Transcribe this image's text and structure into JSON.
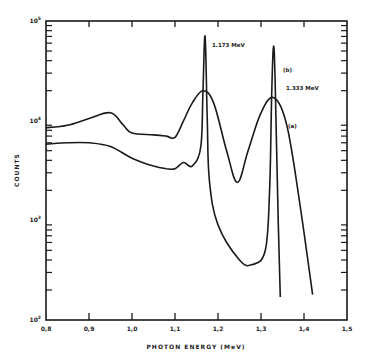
{
  "chart_data": {
    "type": "line",
    "title": "",
    "xlabel": "PHOTON ENERGY (MeV)",
    "ylabel": "COUNTS",
    "xlim": [
      0.8,
      1.5
    ],
    "ylim": [
      100,
      100000
    ],
    "yscale": "log",
    "grid": false,
    "legend": "inline labels",
    "x_ticks": [
      "0.8",
      "0.9",
      "1.0",
      "1.1",
      "1.2",
      "1.3",
      "1.4",
      "1.5"
    ],
    "y_ticks": [
      "10^2",
      "10^3",
      "10^4",
      "10^5"
    ],
    "annotations": [
      {
        "text": "1.173 MeV",
        "x": 1.175,
        "y": 65000
      },
      {
        "text": "1.333 MeV",
        "x": 1.345,
        "y": 25000
      },
      {
        "text": "(b)",
        "x": 1.345,
        "y": 50000
      },
      {
        "text": "(a)",
        "x": 1.37,
        "y": 12000
      }
    ],
    "series": [
      {
        "name": "(a)",
        "description": "broad-resolution spectrum",
        "x": [
          0.8,
          0.85,
          0.9,
          0.95,
          0.98,
          1.0,
          1.05,
          1.08,
          1.1,
          1.12,
          1.14,
          1.165,
          1.19,
          1.22,
          1.245,
          1.27,
          1.3,
          1.33,
          1.36,
          1.39,
          1.42
        ],
        "y": [
          8500,
          9000,
          10500,
          12000,
          9000,
          7500,
          7200,
          7000,
          6800,
          10000,
          15000,
          20000,
          15000,
          5000,
          2400,
          5000,
          12000,
          17000,
          9000,
          1500,
          180
        ]
      },
      {
        "name": "(b)",
        "description": "high-resolution spectrum",
        "x": [
          0.8,
          0.85,
          0.9,
          0.95,
          1.0,
          1.05,
          1.08,
          1.1,
          1.12,
          1.14,
          1.16,
          1.165,
          1.17,
          1.175,
          1.18,
          1.2,
          1.25,
          1.28,
          1.31,
          1.32,
          1.325,
          1.33,
          1.335,
          1.34,
          1.345
        ],
        "y": [
          5800,
          6000,
          6000,
          5500,
          4200,
          3500,
          3300,
          3300,
          3800,
          3500,
          5500,
          20000,
          70000,
          10000,
          2500,
          900,
          400,
          360,
          500,
          2000,
          20000,
          55000,
          10000,
          1000,
          170
        ]
      }
    ]
  },
  "axes": {
    "x_label": "PHOTON ENERGY  (MeV)",
    "y_label": "COUNTS",
    "x_tick_labels": [
      "0.8",
      "0.9",
      "1.0",
      "1.1",
      "1.2",
      "1.3",
      "1.4",
      "1.5"
    ],
    "y_tick_labels": [
      {
        "base": "10",
        "exp": "2"
      },
      {
        "base": "10",
        "exp": "3"
      },
      {
        "base": "10",
        "exp": "4"
      },
      {
        "base": "10",
        "exp": "5"
      }
    ]
  },
  "labels": {
    "peak1": "1.173 MeV",
    "peak2": "1.333 MeV",
    "curve_b": "(b)",
    "curve_a": "(a)"
  },
  "style": {
    "ink": "#1a1a1a",
    "background": "#ffffff"
  }
}
